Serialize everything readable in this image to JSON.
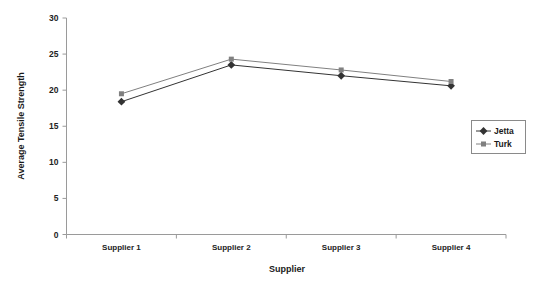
{
  "chart_data": {
    "type": "line",
    "title": "",
    "categories": [
      "Supplier 1",
      "Supplier 2",
      "Supplier 3",
      "Supplier 4"
    ],
    "series": [
      {
        "name": "Jetta",
        "values": [
          18.4,
          23.5,
          22.0,
          20.6
        ],
        "color": "#333333",
        "marker": "diamond"
      },
      {
        "name": "Turk",
        "values": [
          19.5,
          24.3,
          22.8,
          21.2
        ],
        "color": "#808080",
        "marker": "square"
      }
    ],
    "xlabel": "Supplier",
    "ylabel": "Average Tensile Strength",
    "ylim": [
      0,
      30
    ],
    "yticks": [
      0,
      5,
      10,
      15,
      20,
      25,
      30
    ],
    "ytick_labels": [
      "0",
      "5",
      "10",
      "15",
      "20",
      "25",
      "30"
    ],
    "grid": false,
    "legend_position": "right"
  },
  "axes": {
    "y_title": "Average Tensile Strength",
    "x_title": "Supplier"
  },
  "legend": {
    "entries": [
      {
        "label": "Jetta",
        "marker": "diamond-marker",
        "color": "#333333"
      },
      {
        "label": "Turk",
        "marker": "square-marker",
        "color": "#808080"
      }
    ]
  }
}
